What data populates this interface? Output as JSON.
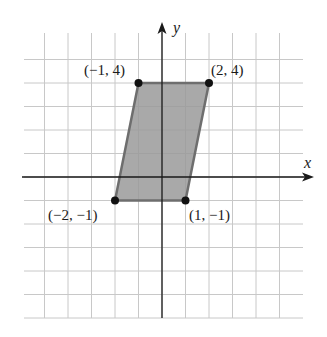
{
  "figure": {
    "x_axis_label": "x",
    "y_axis_label": "y",
    "grid": {
      "xmin": -6,
      "xmax": 6,
      "ymin": -6,
      "ymax": 6,
      "step": 1
    },
    "shape": "parallelogram",
    "fill_color": "#9a9a9a",
    "edge_color": "#6e6e6e",
    "vertices": [
      {
        "label": "(−1, 4)",
        "x": -1,
        "y": 4
      },
      {
        "label": "(2, 4)",
        "x": 2,
        "y": 4
      },
      {
        "label": "(1, −1)",
        "x": 1,
        "y": -1
      },
      {
        "label": "(−2, −1)",
        "x": -2,
        "y": -1
      }
    ]
  }
}
